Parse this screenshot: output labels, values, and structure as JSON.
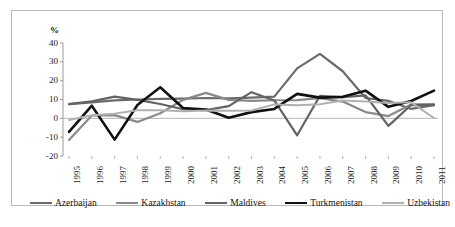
{
  "chart_data": {
    "type": "line",
    "title": "",
    "xlabel": "",
    "ylabel": "%",
    "ylim": [
      -20,
      40
    ],
    "yticks": [
      40,
      30,
      20,
      10,
      0,
      -10,
      -20
    ],
    "grid": false,
    "legend_position": "bottom",
    "categories": [
      "1995",
      "1996",
      "1997",
      "1998",
      "1999",
      "2000",
      "2001",
      "2002",
      "2003",
      "2004",
      "2005",
      "2006",
      "2007",
      "2008",
      "2009",
      "2010",
      "2011"
    ],
    "series": [
      {
        "name": "Azerbaijan",
        "color": "#6b6b6b",
        "values": [
          7.5,
          8.5,
          9.5,
          10.0,
          10.3,
          10.5,
          10.8,
          10.6,
          11.0,
          11.5,
          26.5,
          34.2,
          25.0,
          10.8,
          9.3,
          5.0,
          7.0
        ]
      },
      {
        "name": "Kazakhstan",
        "color": "#8a8a8a",
        "values": [
          -11.5,
          1.5,
          1.7,
          -1.9,
          2.7,
          9.8,
          13.5,
          9.8,
          9.3,
          9.6,
          9.7,
          10.7,
          8.9,
          3.3,
          1.2,
          7.3,
          7.5
        ]
      },
      {
        "name": "Maldives",
        "color": "#636363",
        "values": [
          7.5,
          9.0,
          11.5,
          9.8,
          7.6,
          4.8,
          4.4,
          6.5,
          13.9,
          9.5,
          -9.0,
          12.0,
          11.2,
          12.2,
          -4.0,
          7.1,
          7.0
        ]
      },
      {
        "name": "Turkmenistan",
        "color": "#111111",
        "values": [
          -7.2,
          6.7,
          -11.3,
          7.1,
          16.5,
          5.5,
          4.7,
          0.3,
          3.3,
          5.0,
          13.0,
          11.0,
          11.4,
          14.7,
          6.1,
          9.2,
          14.7
        ]
      },
      {
        "name": "Uzbekistan",
        "color": "#b0b0b0",
        "values": [
          -0.9,
          1.6,
          2.5,
          4.3,
          4.3,
          3.8,
          4.2,
          4.0,
          4.2,
          7.4,
          7.0,
          7.5,
          9.5,
          9.0,
          8.1,
          8.5,
          0.2
        ]
      }
    ]
  },
  "axis": {
    "y_unit_label": "%",
    "tick_labels": [
      "40",
      "30",
      "20",
      "10",
      "0",
      "-10",
      "-20"
    ]
  },
  "legend": {
    "items": [
      {
        "label": "Azerbaijan",
        "color": "#6b6b6b",
        "width": 2.2
      },
      {
        "label": "Kazakhstan",
        "color": "#8a8a8a",
        "width": 2.2
      },
      {
        "label": "Maldives",
        "color": "#636363",
        "width": 2.2
      },
      {
        "label": "Turkmenistan",
        "color": "#111111",
        "width": 2.6
      },
      {
        "label": "Uzbekistan",
        "color": "#b0b0b0",
        "width": 2.0
      }
    ]
  }
}
